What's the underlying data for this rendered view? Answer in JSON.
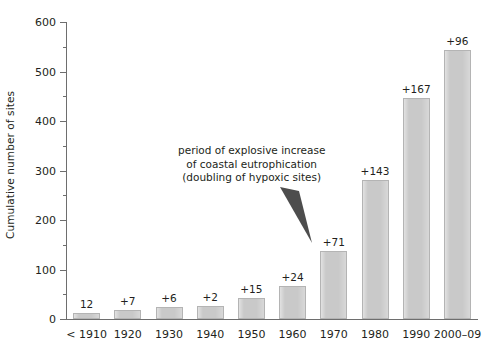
{
  "chart_data": {
    "type": "bar",
    "title": "",
    "xlabel": "",
    "ylabel": "Cumulative number of sites",
    "ylim": [
      0,
      600
    ],
    "ytick_step": 100,
    "yminor_step": 50,
    "grid": false,
    "legend": "none",
    "categories": [
      "< 1910",
      "1920",
      "1930",
      "1940",
      "1950",
      "1960",
      "1970",
      "1980",
      "1990",
      "2000–09"
    ],
    "values": [
      12,
      19,
      25,
      27,
      42,
      66,
      137,
      280,
      447,
      543
    ],
    "increment_labels": [
      "12",
      "+7",
      "+6",
      "+2",
      "+15",
      "+24",
      "+71",
      "+143",
      "+167",
      "+96"
    ],
    "increments": [
      12,
      7,
      6,
      2,
      15,
      24,
      71,
      143,
      167,
      96
    ],
    "ytick_labels": [
      "0",
      "100",
      "200",
      "300",
      "400",
      "500",
      "600"
    ],
    "ytick_values": [
      0,
      100,
      200,
      300,
      400,
      500,
      600
    ],
    "yminor_values": [
      50,
      150,
      250,
      350,
      450,
      550
    ],
    "annotations": [
      {
        "id": "explosive-increase",
        "lines": [
          "period of explosive increase",
          "of coastal eutrophication",
          "(doubling of hypoxic sites)"
        ],
        "points_to_category": "1970"
      }
    ],
    "colors": {
      "bar_fill": "#c9c9c9",
      "bar_edge": "#b4b4b4",
      "axis": "#6e6e6e",
      "text": "#231f20",
      "arrow": "#4d4d4d",
      "background": "#ffffff"
    }
  }
}
